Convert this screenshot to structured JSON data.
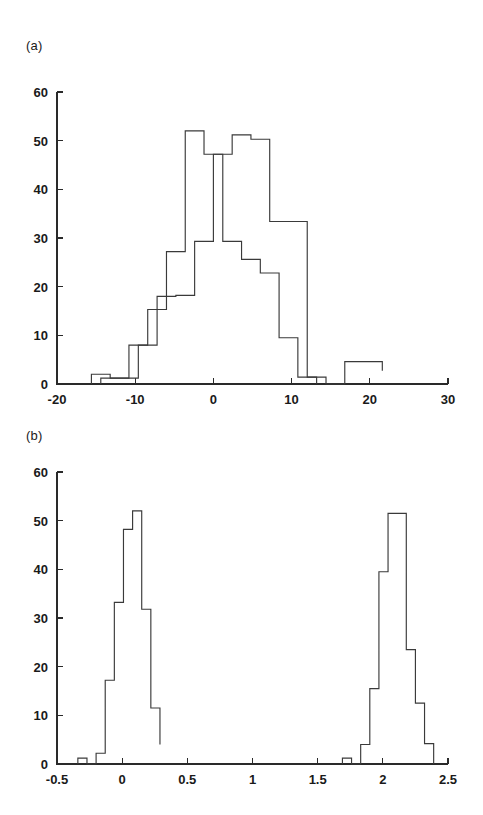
{
  "figure": {
    "background": "#ffffff",
    "line_color": "#3a3a3a",
    "axis_color": "#2a2a2a"
  },
  "panels": {
    "a": {
      "label": "(a)"
    },
    "b": {
      "label": "(b)"
    }
  },
  "chart_data": [
    {
      "type": "line",
      "panel": "(a)",
      "title": "",
      "subtitle": "",
      "xlabel": "",
      "ylabel": "",
      "xlim": [
        -20,
        30
      ],
      "ylim": [
        0,
        60
      ],
      "grid": false,
      "legend": "none",
      "xticks": [
        -20,
        -10,
        0,
        10,
        20,
        30
      ],
      "xtick_labels": [
        "-20",
        "-10",
        "0",
        "10",
        "20",
        "30"
      ],
      "yticks": [
        0,
        10,
        20,
        30,
        40,
        50,
        60
      ],
      "ytick_labels": [
        "0",
        "10",
        "20",
        "30",
        "40",
        "50",
        "60"
      ],
      "annotations": [
        "two overlapping step histograms"
      ],
      "series": [
        {
          "name": "histogram-1",
          "style": "step",
          "bin_edges": [
            -15.6,
            -13.2,
            -10.8,
            -8.4,
            -6.0,
            -3.6,
            -1.2,
            1.2,
            3.6,
            6.0,
            8.4,
            10.8,
            13.2
          ],
          "values": [
            2.0,
            1.2,
            8.0,
            15.3,
            27.2,
            52.0,
            47.2,
            29.3,
            25.6,
            22.8,
            9.5,
            1.4
          ]
        },
        {
          "name": "histogram-2",
          "style": "step",
          "bin_edges": [
            -14.4,
            -12.0,
            -9.6,
            -7.2,
            -4.8,
            -2.4,
            0.0,
            2.4,
            4.8,
            7.2,
            9.6,
            12.0,
            14.4,
            16.8,
            19.2,
            21.6
          ],
          "values": [
            1.2,
            1.2,
            8.0,
            18.0,
            18.2,
            29.3,
            47.2,
            51.2,
            50.3,
            33.4,
            33.4,
            1.4,
            0.0,
            4.6,
            4.6,
            2.7
          ]
        }
      ]
    },
    {
      "type": "line",
      "panel": "(b)",
      "title": "",
      "subtitle": "",
      "xlabel": "",
      "ylabel": "",
      "xlim": [
        -0.5,
        2.5
      ],
      "ylim": [
        0,
        60
      ],
      "grid": false,
      "legend": "none",
      "xticks": [
        -0.5,
        0,
        0.5,
        1,
        1.5,
        2,
        2.5
      ],
      "xtick_labels": [
        "-0.5",
        "0",
        "0.5",
        "1",
        "1.5",
        "2",
        "2.5"
      ],
      "yticks": [
        0,
        10,
        20,
        30,
        40,
        50,
        60
      ],
      "ytick_labels": [
        "0",
        "10",
        "20",
        "30",
        "40",
        "50",
        "60"
      ],
      "annotations": [
        "bimodal step histogram with two narrow peaks near 0 and 2.1"
      ],
      "series": [
        {
          "name": "histogram-bimodal",
          "style": "step",
          "bin_edges": [
            -0.34,
            -0.27,
            -0.2,
            -0.13,
            -0.06,
            0.01,
            0.08,
            0.15,
            0.22,
            0.29
          ],
          "values": [
            1.2,
            0.0,
            2.2,
            17.2,
            33.2,
            48.2,
            52.0,
            31.8,
            11.5,
            4.0
          ]
        },
        {
          "name": "histogram-bimodal-right",
          "style": "step",
          "bin_edges": [
            1.69,
            1.76,
            1.83,
            1.9,
            1.97,
            2.04,
            2.11,
            2.18,
            2.25,
            2.32,
            2.39
          ],
          "values": [
            1.2,
            0.0,
            4.0,
            15.5,
            39.5,
            51.5,
            51.5,
            23.5,
            12.5,
            4.2,
            0.0
          ]
        }
      ]
    }
  ]
}
